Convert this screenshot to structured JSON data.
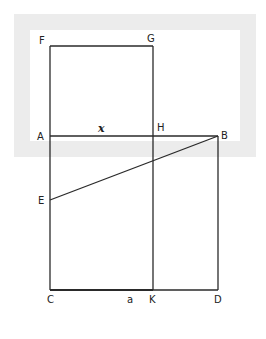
{
  "diagram": {
    "type": "geometric-construction",
    "colors": {
      "line": "#2a2a2a",
      "frame": "#ececec",
      "background": "#ffffff"
    },
    "points": {
      "F": {
        "label": "F",
        "x": 50,
        "y": 46
      },
      "G": {
        "label": "G",
        "x": 153,
        "y": 46
      },
      "A": {
        "label": "A",
        "x": 50,
        "y": 136
      },
      "H": {
        "label": "H",
        "x": 153,
        "y": 136
      },
      "B": {
        "label": "B",
        "x": 218,
        "y": 136
      },
      "E": {
        "label": "E",
        "x": 50,
        "y": 200
      },
      "C": {
        "label": "C",
        "x": 50,
        "y": 290
      },
      "K": {
        "label": "K",
        "x": 153,
        "y": 290
      },
      "D": {
        "label": "D",
        "x": 218,
        "y": 290
      }
    },
    "segments": [
      [
        "F",
        "G"
      ],
      [
        "F",
        "C"
      ],
      [
        "G",
        "K"
      ],
      [
        "A",
        "B"
      ],
      [
        "B",
        "D"
      ],
      [
        "C",
        "D"
      ],
      [
        "E",
        "B"
      ]
    ],
    "annotations": {
      "x_label": "x",
      "a_label": "a"
    }
  }
}
